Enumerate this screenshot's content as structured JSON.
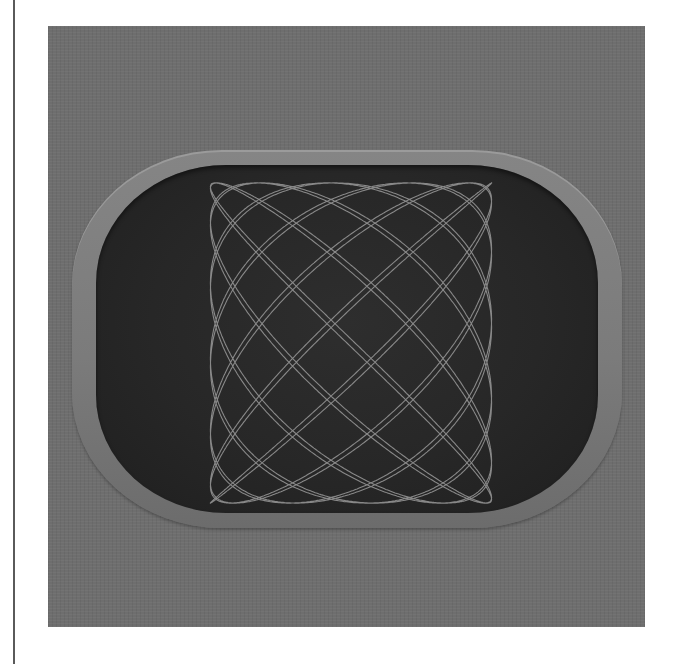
{
  "figure": {
    "colors": {
      "page_background": "#ffffff",
      "frame_background": "#6e6e6e",
      "bezel": "#7f7f7f",
      "screen": "#262626",
      "trace": "#9a9a9a",
      "left_rule": "#5a5a5a"
    },
    "lissajous": {
      "freq_x": 13,
      "freq_y": 11,
      "phase": 0.6,
      "amplitude_x": 0.56,
      "amplitude_y": 0.92
    }
  }
}
